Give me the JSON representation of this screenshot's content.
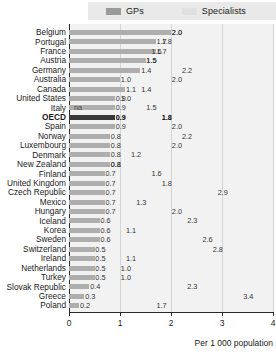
{
  "legend": {
    "gps_label": "GPs",
    "specialists_label": "Specialists",
    "gps_color": "#9a9a9a",
    "specialists_color": "#e0e0e0"
  },
  "axis": {
    "title": "Per 1 000 population",
    "ticks": [
      "0",
      "1",
      "2",
      "3",
      "4"
    ],
    "min": 0,
    "max": 4
  },
  "chart_data": {
    "type": "bar",
    "title": "",
    "subtitle": "",
    "xlabel": "Per 1 000 population",
    "ylabel": "",
    "xlim": [
      0,
      4
    ],
    "grid": true,
    "legend_position": "top",
    "orientation": "horizontal",
    "categories": [
      "Belgium",
      "Portugal",
      "France",
      "Austria",
      "Germany",
      "Australia",
      "Canada",
      "United States",
      "Italy",
      "OECD",
      "Spain",
      "Norway",
      "Luxembourg",
      "Denmark",
      "New Zealand",
      "Finland",
      "United Kingdom",
      "Czech Republic",
      "Mexico",
      "Hungary",
      "Iceland",
      "Korea",
      "Sweden",
      "Switzerland",
      "Ireland",
      "Netherlands",
      "Turkey",
      "Slovak Republic",
      "Greece",
      "Poland"
    ],
    "series": [
      {
        "name": "GPs",
        "values": [
          2.0,
          1.7,
          1.7,
          1.5,
          1.4,
          1.0,
          1.1,
          0.9,
          0.9,
          0.9,
          0.8,
          0.8,
          0.8,
          0.8,
          0.8,
          0.7,
          0.7,
          0.7,
          0.7,
          0.7,
          0.6,
          0.6,
          0.5,
          0.5,
          0.5,
          0.5,
          0.4,
          0.3,
          0.2,
          0.2
        ],
        "labels": [
          "2.0",
          "1.7",
          "1.7",
          "1.5",
          "1.4",
          "1.0",
          "1.1",
          "0.9",
          "0.9",
          "0.9",
          "0.9",
          "0.8",
          "0.8",
          "0.8",
          "0.8",
          "0.7",
          "0.7",
          "0.7",
          "0.7",
          "0.7",
          "0.6",
          "0.6",
          "0.6",
          "0.5",
          "0.5",
          "0.5",
          "0.5",
          "0.4",
          "0.3",
          "0.2"
        ]
      },
      {
        "name": "Specialists",
        "values": [
          2.0,
          1.8,
          1.6,
          1.5,
          2.2,
          2.0,
          1.4,
          1.0,
          1.5,
          1.8,
          2.0,
          2.2,
          2.0,
          1.2,
          0.8,
          1.6,
          1.8,
          2.9,
          1.3,
          2.0,
          2.3,
          1.1,
          2.6,
          2.8,
          1.1,
          1.0,
          1.0,
          2.3,
          3.4,
          1.7
        ],
        "labels": [
          "2.0",
          "1.8",
          "1.6",
          "1.5",
          "2.2",
          "2.0",
          "1.4",
          "1.0",
          "1.5",
          "1.8",
          "2.0",
          "2.2",
          "2.0",
          "1.2",
          "0.8",
          "1.6",
          "1.8",
          "2.9",
          "1.3",
          "2.0",
          "2.3",
          "1.1",
          "2.6",
          "2.8",
          "1.1",
          "1.0",
          "1.0",
          "2.3",
          "3.4",
          "1.7"
        ]
      }
    ],
    "annotations": [
      {
        "category": "Italy",
        "text": "na",
        "position": 0.05
      }
    ],
    "highlight": "OECD"
  },
  "rows": [
    {
      "country": "Belgium",
      "gp": 2.0,
      "gp_label": "2.0",
      "spec": 2.0,
      "spec_label": "2.0",
      "highlight": false,
      "na": ""
    },
    {
      "country": "Portugal",
      "gp": 1.7,
      "gp_label": "1.7",
      "spec": 1.8,
      "spec_label": "1.8",
      "highlight": false,
      "na": ""
    },
    {
      "country": "France",
      "gp": 1.7,
      "gp_label": "1.7",
      "spec": 1.6,
      "spec_label": "1.6",
      "highlight": false,
      "na": ""
    },
    {
      "country": "Austria",
      "gp": 1.5,
      "gp_label": "1.5",
      "spec": 1.5,
      "spec_label": "1.5",
      "highlight": false,
      "na": ""
    },
    {
      "country": "Germany",
      "gp": 1.4,
      "gp_label": "1.4",
      "spec": 2.2,
      "spec_label": "2.2",
      "highlight": false,
      "na": ""
    },
    {
      "country": "Australia",
      "gp": 1.0,
      "gp_label": "1.0",
      "spec": 2.0,
      "spec_label": "2.0",
      "highlight": false,
      "na": ""
    },
    {
      "country": "Canada",
      "gp": 1.1,
      "gp_label": "1.1",
      "spec": 1.4,
      "spec_label": "1.4",
      "highlight": false,
      "na": ""
    },
    {
      "country": "United States",
      "gp": 0.9,
      "gp_label": "0.9",
      "spec": 1.0,
      "spec_label": "1.0",
      "highlight": false,
      "na": ""
    },
    {
      "country": "Italy",
      "gp": 0.9,
      "gp_label": "0.9",
      "spec": 1.5,
      "spec_label": "1.5",
      "highlight": false,
      "na": "na"
    },
    {
      "country": "OECD",
      "gp": 0.9,
      "gp_label": "0.9",
      "spec": 1.8,
      "spec_label": "1.8",
      "highlight": true,
      "na": ""
    },
    {
      "country": "Spain",
      "gp": 0.9,
      "gp_label": "0.9",
      "spec": 2.0,
      "spec_label": "2.0",
      "highlight": false,
      "na": ""
    },
    {
      "country": "Norway",
      "gp": 0.8,
      "gp_label": "0.8",
      "spec": 2.2,
      "spec_label": "2.2",
      "highlight": false,
      "na": ""
    },
    {
      "country": "Luxembourg",
      "gp": 0.8,
      "gp_label": "0.8",
      "spec": 2.0,
      "spec_label": "2.0",
      "highlight": false,
      "na": ""
    },
    {
      "country": "Denmark",
      "gp": 0.8,
      "gp_label": "0.8",
      "spec": 1.2,
      "spec_label": "1.2",
      "highlight": false,
      "na": ""
    },
    {
      "country": "New Zealand",
      "gp": 0.8,
      "gp_label": "0.8",
      "spec": 0.8,
      "spec_label": "0.8",
      "highlight": false,
      "na": ""
    },
    {
      "country": "Finland",
      "gp": 0.7,
      "gp_label": "0.7",
      "spec": 1.6,
      "spec_label": "1.6",
      "highlight": false,
      "na": ""
    },
    {
      "country": "United Kingdom",
      "gp": 0.7,
      "gp_label": "0.7",
      "spec": 1.8,
      "spec_label": "1.8",
      "highlight": false,
      "na": ""
    },
    {
      "country": "Czech Republic",
      "gp": 0.7,
      "gp_label": "0.7",
      "spec": 2.9,
      "spec_label": "2.9",
      "highlight": false,
      "na": ""
    },
    {
      "country": "Mexico",
      "gp": 0.7,
      "gp_label": "0.7",
      "spec": 1.3,
      "spec_label": "1.3",
      "highlight": false,
      "na": ""
    },
    {
      "country": "Hungary",
      "gp": 0.7,
      "gp_label": "0.7",
      "spec": 2.0,
      "spec_label": "2.0",
      "highlight": false,
      "na": ""
    },
    {
      "country": "Iceland",
      "gp": 0.6,
      "gp_label": "0.6",
      "spec": 2.3,
      "spec_label": "2.3",
      "highlight": false,
      "na": ""
    },
    {
      "country": "Korea",
      "gp": 0.6,
      "gp_label": "0.6",
      "spec": 1.1,
      "spec_label": "1.1",
      "highlight": false,
      "na": ""
    },
    {
      "country": "Sweden",
      "gp": 0.6,
      "gp_label": "0.6",
      "spec": 2.6,
      "spec_label": "2.6",
      "highlight": false,
      "na": ""
    },
    {
      "country": "Switzerland",
      "gp": 0.5,
      "gp_label": "0.5",
      "spec": 2.8,
      "spec_label": "2.8",
      "highlight": false,
      "na": ""
    },
    {
      "country": "Ireland",
      "gp": 0.5,
      "gp_label": "0.5",
      "spec": 1.1,
      "spec_label": "1.1",
      "highlight": false,
      "na": ""
    },
    {
      "country": "Netherlands",
      "gp": 0.5,
      "gp_label": "0.5",
      "spec": 1.0,
      "spec_label": "1.0",
      "highlight": false,
      "na": ""
    },
    {
      "country": "Turkey",
      "gp": 0.5,
      "gp_label": "0.5",
      "spec": 1.0,
      "spec_label": "1.0",
      "highlight": false,
      "na": ""
    },
    {
      "country": "Slovak Republic",
      "gp": 0.4,
      "gp_label": "0.4",
      "spec": 2.3,
      "spec_label": "2.3",
      "highlight": false,
      "na": ""
    },
    {
      "country": "Greece",
      "gp": 0.3,
      "gp_label": "0.3",
      "spec": 3.4,
      "spec_label": "3.4",
      "highlight": false,
      "na": ""
    },
    {
      "country": "Poland",
      "gp": 0.2,
      "gp_label": "0.2",
      "spec": 1.7,
      "spec_label": "1.7",
      "highlight": false,
      "na": ""
    }
  ]
}
